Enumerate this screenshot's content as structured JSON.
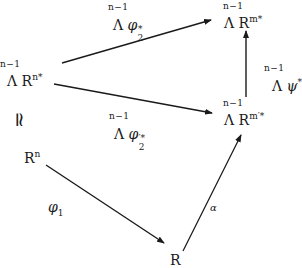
{
  "diagram": {
    "type": "commutative-diagram",
    "nodes": {
      "lambda_rn_star": {
        "degree": "n−1",
        "op": "Λ",
        "base": "R",
        "sup": "n*"
      },
      "lambda_rm_star": {
        "degree": "n−1",
        "op": "Λ",
        "base": "R",
        "sup": "m*"
      },
      "lambda_rm_prime_star": {
        "degree": "n−1",
        "op": "Λ",
        "base": "R",
        "sup": "m′*"
      },
      "rn": {
        "base": "R",
        "sup": "n"
      },
      "r": {
        "base": "R"
      }
    },
    "edge_labels": {
      "phi2_star": {
        "degree": "n−1",
        "op": "Λ",
        "symbol": "φ",
        "sup": "*",
        "sub": "2"
      },
      "phi2_prime_star": {
        "degree": "n−1",
        "op": "Λ",
        "symbol": "φ",
        "sup": "′*",
        "sub": "2"
      },
      "psi_star": {
        "degree": "n−1",
        "op": "Λ",
        "symbol": "ψ",
        "sup": "*"
      },
      "phi1": {
        "symbol": "φ",
        "sub": "1"
      },
      "alpha": {
        "symbol": "α"
      }
    },
    "isomorphism_symbol": "≃",
    "edges": [
      {
        "from": "lambda_rn_star",
        "to": "lambda_rm_star",
        "label": "phi2_star"
      },
      {
        "from": "lambda_rn_star",
        "to": "lambda_rm_prime_star",
        "label": "phi2_prime_star"
      },
      {
        "from": "lambda_rm_prime_star",
        "to": "lambda_rm_star",
        "label": "psi_star"
      },
      {
        "from": "rn",
        "to": "r",
        "label": "phi1"
      },
      {
        "from": "r",
        "to": "lambda_rm_prime_star",
        "label": "alpha"
      }
    ],
    "colors": {
      "ink": "#1a1a1a",
      "background": "#ffffff"
    }
  }
}
